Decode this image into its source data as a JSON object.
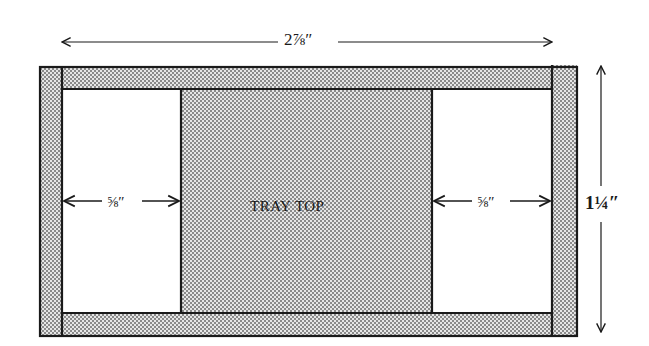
{
  "diagram": {
    "labels": {
      "overall_width": "2⅞″",
      "overall_height": "1¼″",
      "left_gap": "⅝″",
      "right_gap": "⅝″",
      "center_panel": "TRAY TOP"
    },
    "parts": [
      {
        "name": "top-rail",
        "fill": "stippled"
      },
      {
        "name": "bottom-rail",
        "fill": "stippled"
      },
      {
        "name": "left-stile",
        "fill": "stippled"
      },
      {
        "name": "right-stile",
        "fill": "stippled"
      },
      {
        "name": "center-panel",
        "fill": "stippled",
        "label": "TRAY TOP"
      },
      {
        "name": "left-opening",
        "fill": "white",
        "dimension": "⅝″"
      },
      {
        "name": "right-opening",
        "fill": "white",
        "dimension": "⅝″"
      }
    ],
    "colors": {
      "line": "#1a1a1a",
      "stipple_dot": "#7a7a7a",
      "background": "#ffffff"
    }
  }
}
